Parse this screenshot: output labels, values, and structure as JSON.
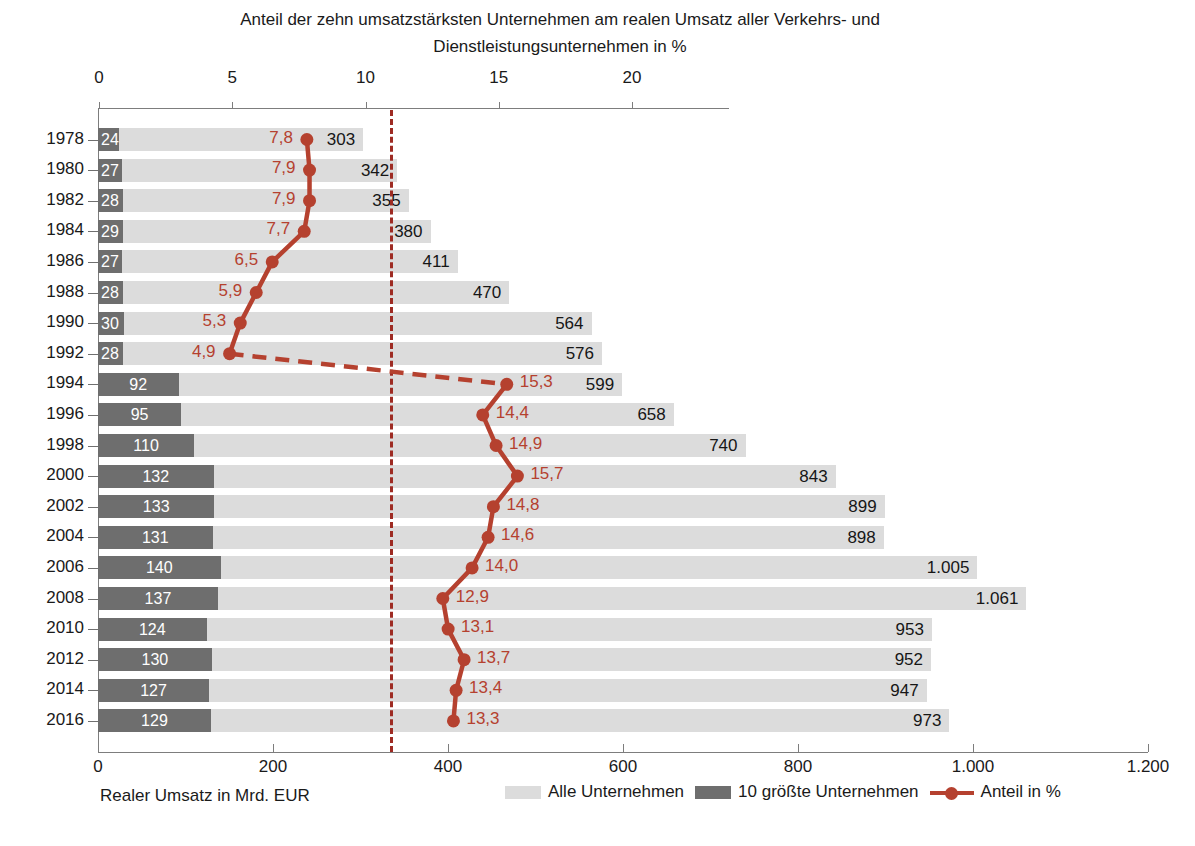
{
  "title": {
    "line1": "Anteil der zehn umsatzstärksten Unternehmen am realen Umsatz aller Verkehrs- und",
    "line2": "Dienstleistungsunternehmen in %"
  },
  "axes": {
    "top_label": "",
    "bottom_caption": "Realer Umsatz in Mrd. EUR",
    "top_ticks": [
      "0",
      "5",
      "10",
      "15",
      "20"
    ],
    "bottom_ticks": [
      "0",
      "200",
      "400",
      "600",
      "800",
      "1.000",
      "1.200"
    ]
  },
  "legend": [
    {
      "key": "alle",
      "label": "Alle Unternehmen",
      "color": "#dcdcdc",
      "type": "swatch"
    },
    {
      "key": "top10",
      "label": "10 größte Unternehmen",
      "color": "#6e6e6e",
      "type": "swatch"
    },
    {
      "key": "anteil",
      "label": "Anteil in %",
      "color": "#b5412f",
      "type": "line-marker"
    }
  ],
  "chart_data": {
    "type": "bar",
    "title": "Anteil der zehn umsatzstärksten Unternehmen am realen Umsatz aller Verkehrs- und Dienstleistungsunternehmen in %",
    "xlabel": "Realer Umsatz in Mrd. EUR",
    "ylabel": "",
    "orientation": "horizontal",
    "grid": false,
    "legend_position": "bottom",
    "xlim_bottom": [
      0,
      1200
    ],
    "xlim_top": [
      0,
      22
    ],
    "top_axis_title": "Anteil in %",
    "categories": [
      "1978",
      "1980",
      "1982",
      "1984",
      "1986",
      "1988",
      "1990",
      "1992",
      "1994",
      "1996",
      "1998",
      "2000",
      "2002",
      "2004",
      "2006",
      "2008",
      "2010",
      "2012",
      "2014",
      "2016"
    ],
    "series": [
      {
        "name": "Alle Unternehmen",
        "unit": "Mrd. EUR",
        "color": "#dcdcdc",
        "axis": "bottom",
        "values": [
          303,
          342,
          355,
          380,
          411,
          470,
          564,
          576,
          599,
          658,
          740,
          843,
          899,
          898,
          1005,
          1061,
          953,
          952,
          947,
          973
        ],
        "labels": [
          "303",
          "342",
          "355",
          "380",
          "411",
          "470",
          "564",
          "576",
          "599",
          "658",
          "740",
          "843",
          "899",
          "898",
          "1.005",
          "1.061",
          "953",
          "952",
          "947",
          "973"
        ]
      },
      {
        "name": "10 größte Unternehmen",
        "unit": "Mrd. EUR",
        "color": "#6e6e6e",
        "axis": "bottom",
        "values": [
          24,
          27,
          28,
          29,
          27,
          28,
          30,
          28,
          92,
          95,
          110,
          132,
          133,
          131,
          140,
          137,
          124,
          130,
          127,
          129
        ],
        "labels": [
          "24",
          "27",
          "28",
          "29",
          "27",
          "28",
          "30",
          "28",
          "92",
          "95",
          "110",
          "132",
          "133",
          "131",
          "140",
          "137",
          "124",
          "130",
          "127",
          "129"
        ]
      },
      {
        "name": "Anteil in %",
        "unit": "%",
        "color": "#b5412f",
        "axis": "top",
        "type": "line",
        "break_after_index": 7,
        "values": [
          7.8,
          7.9,
          7.9,
          7.7,
          6.5,
          5.9,
          5.3,
          4.9,
          15.3,
          14.4,
          14.9,
          15.7,
          14.8,
          14.6,
          14.0,
          12.9,
          13.1,
          13.7,
          13.4,
          13.3
        ],
        "labels": [
          "7,8",
          "7,9",
          "7,9",
          "7,7",
          "6,5",
          "5,9",
          "5,3",
          "4,9",
          "15,3",
          "14,4",
          "14,9",
          "15,7",
          "14,8",
          "14,6",
          "14,0",
          "12,9",
          "13,1",
          "13,7",
          "13,4",
          "13,3"
        ]
      }
    ],
    "annotations": [
      {
        "name": "reference-line",
        "type": "vertical-dashed",
        "value_bottom_axis": 334,
        "value_top_axis": 11.1,
        "color": "#9e2b23"
      }
    ]
  },
  "colors": {
    "light_bar": "#dcdcdc",
    "dark_bar": "#6e6e6e",
    "accent_red": "#b5412f",
    "ref_red": "#9e2b23",
    "axis_gray": "#7d7d7d",
    "text": "#1a1a1a"
  }
}
